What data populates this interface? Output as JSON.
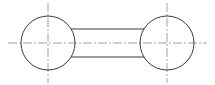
{
  "diagram": {
    "type": "mechanical-drawing",
    "colors": {
      "outline": "#3a3a3a",
      "centerline": "#8a8a8a",
      "background": "#ffffff"
    },
    "circles": [
      {
        "id": "left",
        "cx": 48,
        "cy": 43,
        "r": 27
      },
      {
        "id": "right",
        "cx": 167,
        "cy": 43,
        "r": 27
      }
    ],
    "bar": {
      "x1": 74,
      "x2": 141,
      "y_top": 29,
      "y_bottom": 57
    },
    "centerlines": {
      "horizontal": {
        "x1": 8,
        "x2": 207,
        "y": 43
      },
      "vertical_left": {
        "x": 48,
        "y1": 3,
        "y2": 83
      },
      "vertical_right": {
        "x": 167,
        "y1": 3,
        "y2": 83
      }
    }
  }
}
